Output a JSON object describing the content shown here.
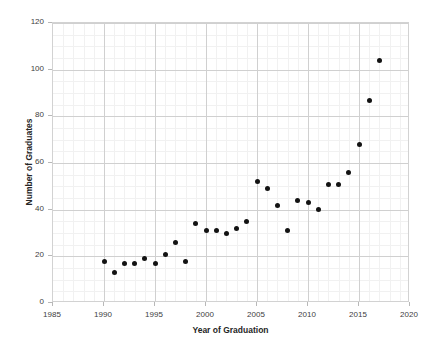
{
  "chart_data": {
    "type": "scatter",
    "title": "",
    "xlabel": "Year of Graduation",
    "ylabel": "Number of Graduates",
    "xlim": [
      1985,
      2020
    ],
    "ylim": [
      0,
      120
    ],
    "xticks": [
      1985,
      1990,
      1995,
      2000,
      2005,
      2010,
      2015,
      2020
    ],
    "yticks": [
      0,
      20,
      40,
      60,
      80,
      100,
      120
    ],
    "grid": true,
    "minor_grid": true,
    "legend": null,
    "marker_color": "#131313",
    "grid_color": "#d0d0d0",
    "background_color": "#ffffff",
    "x": [
      1990,
      1991,
      1992,
      1993,
      1994,
      1995,
      1996,
      1997,
      1998,
      1999,
      2000,
      2001,
      2002,
      2003,
      2004,
      2005,
      2006,
      2007,
      2008,
      2009,
      2010,
      2011,
      2012,
      2013,
      2014,
      2015,
      2016,
      2017
    ],
    "values": [
      18,
      13,
      17,
      17,
      19,
      17,
      21,
      26,
      18,
      34,
      31,
      31,
      30,
      32,
      35,
      52,
      49,
      42,
      31,
      44,
      43,
      40,
      51,
      51,
      56,
      68,
      87,
      104
    ],
    "points": [
      {
        "x": 1990,
        "y": 18
      },
      {
        "x": 1991,
        "y": 13
      },
      {
        "x": 1992,
        "y": 17
      },
      {
        "x": 1993,
        "y": 17
      },
      {
        "x": 1994,
        "y": 19
      },
      {
        "x": 1995,
        "y": 17
      },
      {
        "x": 1996,
        "y": 21
      },
      {
        "x": 1997,
        "y": 26
      },
      {
        "x": 1998,
        "y": 18
      },
      {
        "x": 1999,
        "y": 34
      },
      {
        "x": 2000,
        "y": 31
      },
      {
        "x": 2001,
        "y": 31
      },
      {
        "x": 2002,
        "y": 30
      },
      {
        "x": 2003,
        "y": 32
      },
      {
        "x": 2004,
        "y": 35
      },
      {
        "x": 2005,
        "y": 52
      },
      {
        "x": 2006,
        "y": 49
      },
      {
        "x": 2007,
        "y": 42
      },
      {
        "x": 2008,
        "y": 31
      },
      {
        "x": 2009,
        "y": 44
      },
      {
        "x": 2010,
        "y": 43
      },
      {
        "x": 2011,
        "y": 40
      },
      {
        "x": 2012,
        "y": 51
      },
      {
        "x": 2013,
        "y": 51
      },
      {
        "x": 2014,
        "y": 56
      },
      {
        "x": 2015,
        "y": 68
      },
      {
        "x": 2016,
        "y": 87
      },
      {
        "x": 2017,
        "y": 104
      }
    ]
  }
}
